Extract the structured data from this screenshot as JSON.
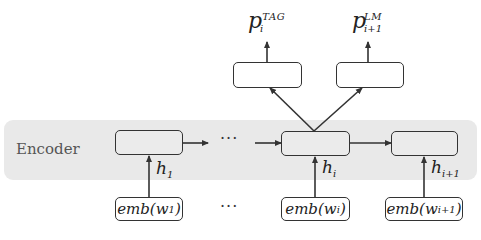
{
  "diagram": {
    "encoder_label": "Encoder",
    "ellipsis": "···",
    "outputs": [
      {
        "var": "p",
        "sub": "i",
        "sup": "TAG"
      },
      {
        "var": "p",
        "sub": "i+1",
        "sup": "LM"
      }
    ],
    "hidden_states": [
      {
        "var": "h",
        "sub": "1"
      },
      {
        "var": "h",
        "sub": "i"
      },
      {
        "var": "h",
        "sub": "i+1"
      }
    ],
    "embeddings": [
      {
        "prefix": "emb(w",
        "sub": "1",
        "suffix": ")"
      },
      {
        "prefix": "emb(w",
        "sub": "i",
        "suffix": ")"
      },
      {
        "prefix": "emb(w",
        "sub": "i+1",
        "suffix": ")"
      }
    ],
    "colors": {
      "band": "#e9e9e9",
      "stroke": "#333333"
    }
  }
}
